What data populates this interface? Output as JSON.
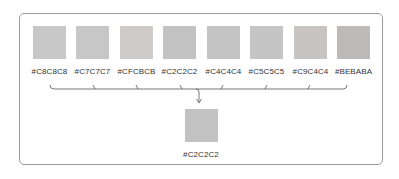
{
  "inputs": [
    {
      "label": "#C8C8C8",
      "color": "#C8C8C8"
    },
    {
      "label": "#C7C7C7",
      "color": "#C7C7C7"
    },
    {
      "label": "#CFCBCB",
      "color": "#CFCBCB"
    },
    {
      "label": "#C2C2C2",
      "color": "#C2C2C2"
    },
    {
      "label": "#C4C4C4",
      "color": "#C4C4C4"
    },
    {
      "label": "#C5C5C5",
      "color": "#C5C5C5"
    },
    {
      "label": "#C9C4C4",
      "color": "#C9C4C4"
    },
    {
      "label": "#BEBABA",
      "color": "#BEBABA"
    }
  ],
  "result": {
    "label": "#C2C2C2",
    "color": "#C2C2C2"
  },
  "colors": {
    "frame": "#9c9c9c",
    "connector": "#555555",
    "text": "#333333"
  }
}
